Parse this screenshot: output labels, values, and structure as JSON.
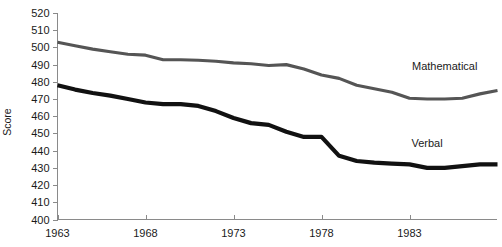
{
  "chart_data": {
    "type": "line",
    "title": "",
    "xlabel": "",
    "ylabel": "Score",
    "xlim": [
      1963,
      1987
    ],
    "ylim": [
      400,
      520
    ],
    "ytick_step": 10,
    "yticks": [
      400,
      410,
      420,
      430,
      440,
      450,
      460,
      470,
      480,
      490,
      500,
      510,
      520
    ],
    "ytick_labels": [
      "400",
      "410",
      "420",
      "430",
      "440",
      "450",
      "460",
      "470",
      "480",
      "490",
      "500",
      "510",
      "520"
    ],
    "xticks": [
      1963,
      1968,
      1973,
      1978,
      1983
    ],
    "xtick_labels": [
      "1963",
      "1968",
      "1973",
      "1978",
      "1983"
    ],
    "grid": false,
    "legend_position": "inline-right",
    "x": [
      1963,
      1964,
      1965,
      1966,
      1967,
      1968,
      1969,
      1970,
      1971,
      1972,
      1973,
      1974,
      1975,
      1976,
      1977,
      1978,
      1979,
      1980,
      1981,
      1982,
      1983,
      1984,
      1985,
      1986,
      1987
    ],
    "series": [
      {
        "name": "Mathematical",
        "color": "#555555",
        "line_width": 3.1,
        "label_x": 1985,
        "label_y": 487,
        "values": [
          503,
          501,
          499,
          498,
          496,
          496,
          493,
          493,
          493,
          492,
          491,
          490,
          488,
          489,
          487,
          484,
          483,
          480,
          478,
          476,
          476,
          474,
          473,
          473,
          472
        ]
      },
      {
        "name": "Verbal",
        "color": "#111111",
        "line_width": 4.2,
        "label_x": 1984,
        "label_y": 442,
        "values": [
          478,
          475,
          473,
          471,
          467,
          467,
          466,
          465,
          462,
          459,
          455,
          449,
          448,
          444,
          441,
          440,
          440,
          439,
          436,
          435,
          435,
          434,
          435,
          438,
          437
        ]
      }
    ],
    "note_series_display": [
      {
        "name": "Mathematical",
        "points": [
          [
            1963,
            503
          ],
          [
            1964,
            501
          ],
          [
            1965,
            499
          ],
          [
            1966,
            497.5
          ],
          [
            1967,
            496
          ],
          [
            1968,
            495.5
          ],
          [
            1969,
            492.8
          ],
          [
            1970,
            492.8
          ],
          [
            1971,
            492.5
          ],
          [
            1972,
            492
          ],
          [
            1973,
            491
          ],
          [
            1974,
            490.5
          ],
          [
            1975,
            489.5
          ],
          [
            1976,
            490
          ],
          [
            1977,
            487.5
          ],
          [
            1978,
            484
          ],
          [
            1979,
            482
          ],
          [
            1980,
            478
          ],
          [
            1981,
            476
          ],
          [
            1982,
            474
          ],
          [
            1983,
            470.5
          ],
          [
            1984,
            470
          ],
          [
            1985,
            470
          ],
          [
            1986,
            470.5
          ],
          [
            1987,
            473
          ],
          [
            1988,
            475
          ],
          [
            1989,
            478
          ],
          [
            1990,
            480
          ],
          [
            1991,
            477.5
          ],
          [
            1992,
            479
          ]
        ]
      },
      {
        "name": "Verbal",
        "points": [
          [
            1963,
            478
          ],
          [
            1964,
            475.5
          ],
          [
            1965,
            473.5
          ],
          [
            1966,
            472
          ],
          [
            1967,
            470
          ],
          [
            1968,
            468
          ],
          [
            1969,
            467
          ],
          [
            1970,
            467
          ],
          [
            1971,
            466
          ],
          [
            1972,
            463
          ],
          [
            1973,
            459
          ],
          [
            1974,
            456
          ],
          [
            1975,
            455
          ],
          [
            1976,
            451
          ],
          [
            1977,
            448
          ],
          [
            1978,
            448
          ],
          [
            1979,
            437
          ],
          [
            1980,
            434
          ],
          [
            1981,
            433
          ],
          [
            1982,
            432.5
          ],
          [
            1983,
            432
          ],
          [
            1984,
            430
          ],
          [
            1985,
            430
          ],
          [
            1986,
            431
          ],
          [
            1987,
            432
          ],
          [
            1988,
            432
          ],
          [
            1989,
            432
          ],
          [
            1990,
            437
          ],
          [
            1991,
            436
          ],
          [
            1992,
            436
          ]
        ]
      }
    ]
  }
}
